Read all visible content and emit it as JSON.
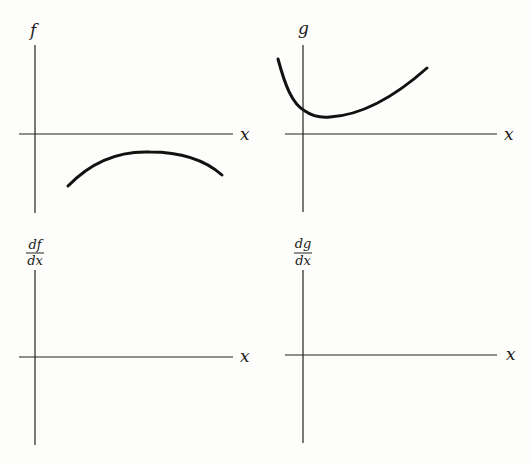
{
  "panels": [
    {
      "id": "f",
      "y_label": "f",
      "x_label": "x",
      "description": "Given function f: negative, concave-down arc below x-axis"
    },
    {
      "id": "g",
      "y_label": "g",
      "x_label": "x",
      "description": "Given function g: positive, decreasing then increasing with minimum just right of y-axis"
    },
    {
      "id": "df",
      "y_label_num": "df",
      "y_label_den": "dx",
      "x_label": "x",
      "description": "Blank axes to sketch derivative of f"
    },
    {
      "id": "dg",
      "y_label_num": "dg",
      "y_label_den": "dx",
      "x_label": "x",
      "description": "Blank axes to sketch derivative of g"
    }
  ],
  "colors": {
    "background": "#fdfdfb",
    "ink": "#111111"
  }
}
